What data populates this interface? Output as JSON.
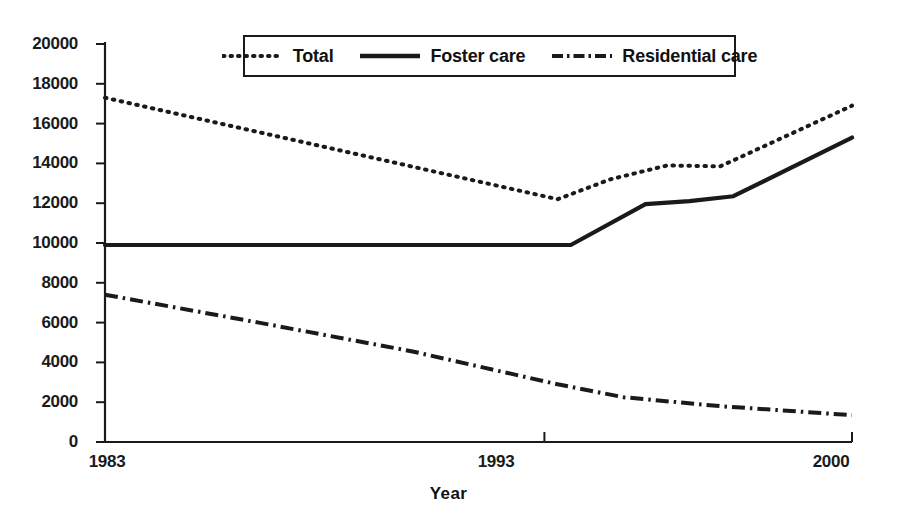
{
  "chart_data": {
    "type": "line",
    "title": "",
    "xlabel": "Year",
    "ylabel": "",
    "xlim": [
      1983,
      2000
    ],
    "ylim": [
      0,
      20000
    ],
    "grid": false,
    "legend_position": "top-center",
    "x_tick_labels": [
      "1983",
      "1993",
      "2000"
    ],
    "x_tick_values": [
      1983,
      1993,
      2000
    ],
    "y_tick_labels": [
      "0",
      "2000",
      "4000",
      "6000",
      "8000",
      "10000",
      "12000",
      "14000",
      "16000",
      "18000",
      "20000"
    ],
    "y_tick_values": [
      0,
      2000,
      4000,
      6000,
      8000,
      10000,
      12000,
      14000,
      16000,
      18000,
      20000
    ],
    "series": [
      {
        "name": "Total",
        "style": "dotted",
        "color": "#1a1a1a",
        "x": [
          1983,
          1993.3,
          1994.5,
          1995.8,
          1997.0,
          2000
        ],
        "values": [
          17300,
          12200,
          13200,
          13900,
          13850,
          16900
        ]
      },
      {
        "name": "Foster care",
        "style": "solid",
        "color": "#1a1a1a",
        "x": [
          1983,
          1993.3,
          1993.6,
          1995.3,
          1996.3,
          1997.3,
          2000
        ],
        "values": [
          9900,
          9900,
          9900,
          11950,
          12100,
          12350,
          15300
        ]
      },
      {
        "name": "Residential care",
        "style": "dash-dot",
        "color": "#1a1a1a",
        "x": [
          1983,
          1986.5,
          1990.0,
          1993.3,
          1994.8,
          1997.0,
          2000
        ],
        "values": [
          7400,
          6000,
          4550,
          2900,
          2250,
          1800,
          1350
        ]
      }
    ]
  },
  "legend": {
    "entries": [
      {
        "label": "Total"
      },
      {
        "label": "Foster care"
      },
      {
        "label": "Residential care"
      }
    ]
  },
  "axis": {
    "x_title": "Year"
  }
}
